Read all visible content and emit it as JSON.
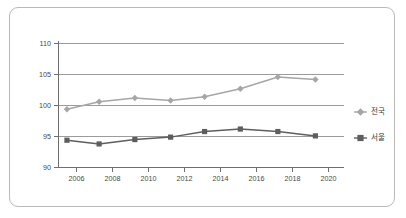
{
  "chart_data": {
    "type": "line",
    "title": "",
    "subtitle": "",
    "xlabel": "",
    "ylabel": "",
    "x": [
      2005.5,
      2007.3,
      2009.3,
      2011.3,
      2013.2,
      2015.2,
      2017.3,
      2019.4
    ],
    "categories": [
      "2006",
      "2008",
      "2010",
      "2012",
      "2014",
      "2016",
      "2018",
      "2020"
    ],
    "xlim": [
      2005,
      2021
    ],
    "ylim": [
      90,
      110
    ],
    "x_ticks": [
      2006,
      2008,
      2010,
      2012,
      2014,
      2016,
      2018,
      2020
    ],
    "x_tick_labels": [
      "2006",
      "2008",
      "2010",
      "2012",
      "2014",
      "2016",
      "2018",
      "2020"
    ],
    "y_ticks": [
      90,
      95,
      100,
      105,
      110
    ],
    "y_tick_labels": [
      "90",
      "95",
      "100",
      "105",
      "110"
    ],
    "grid": true,
    "grid_axis": "y",
    "legend_position": "right",
    "series": [
      {
        "name": "전국",
        "color": "#a6a6a6",
        "marker": "diamond",
        "values": [
          99.4,
          100.6,
          101.2,
          100.8,
          101.4,
          102.7,
          104.6,
          104.2
        ]
      },
      {
        "name": "서울",
        "color": "#5e5e5e",
        "marker": "square",
        "values": [
          94.4,
          93.8,
          94.5,
          94.9,
          95.8,
          96.2,
          95.8,
          95.1
        ]
      }
    ]
  },
  "legend": {
    "entries": [
      {
        "label": "전국"
      },
      {
        "label": "서울"
      }
    ]
  },
  "axes": {
    "y_labels": [
      "110",
      "105",
      "100",
      "95",
      "90"
    ],
    "x_labels": [
      "2006",
      "2008",
      "2010",
      "2012",
      "2014",
      "2016",
      "2018",
      "2020"
    ]
  },
  "colors": {
    "series_national": "#a6a6a6",
    "series_seoul": "#5e5e5e",
    "gridline": "#9b9b9b",
    "axis": "#6e6e6e",
    "frame": "#b9b9b9",
    "tick_text": "#4a4a4a"
  }
}
